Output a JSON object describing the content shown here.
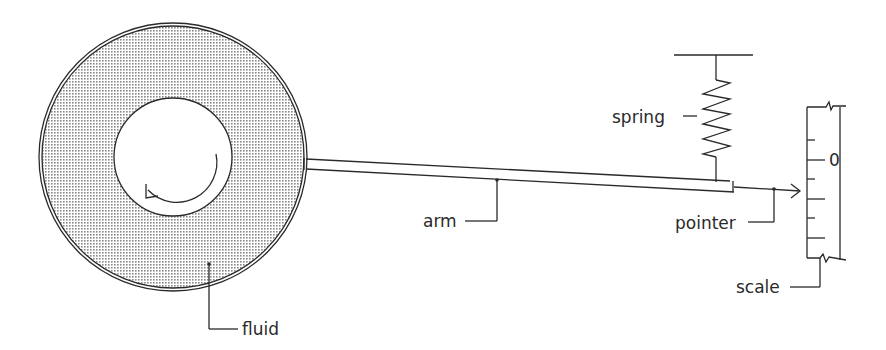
{
  "diagram": {
    "type": "rotational viscometer schematic",
    "labels": {
      "fluid": "fluid",
      "arm": "arm",
      "spring": "spring",
      "pointer": "pointer",
      "scale": "scale",
      "scale_zero": "0"
    },
    "colors": {
      "ink": "#2a2a2a",
      "fluid_fill": "#bdbdbd",
      "background": "#ffffff"
    },
    "components": [
      {
        "name": "outer-cylinder",
        "shape": "circle"
      },
      {
        "name": "inner-cylinder",
        "shape": "circle",
        "rotation": "counter-clockwise arrow"
      },
      {
        "name": "fluid",
        "shape": "annulus, stippled"
      },
      {
        "name": "arm",
        "shape": "tapered bar"
      },
      {
        "name": "spring",
        "shape": "zigzag"
      },
      {
        "name": "pointer",
        "shape": "arrow"
      },
      {
        "name": "scale",
        "shape": "vertical graduated scale"
      }
    ]
  }
}
